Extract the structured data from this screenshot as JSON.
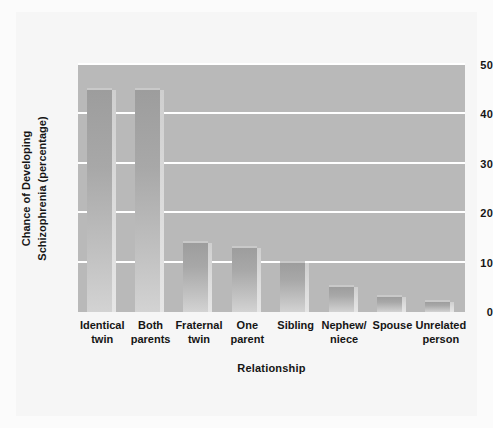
{
  "chart_data": {
    "type": "bar",
    "title": "",
    "xlabel": "Relationship",
    "ylabel": "Chance of Developing Schizophrenia (percentage)",
    "ylabel_lines": [
      "Chance of Developing",
      "Schizophrenia (percentage)"
    ],
    "categories": [
      "Identical\ntwin",
      "Both\nparents",
      "Fraternal\ntwin",
      "One\nparent",
      "Sibling",
      "Nephew/\nniece",
      "Spouse",
      "Unrelated\nperson"
    ],
    "values": [
      45,
      45,
      14,
      13,
      10,
      5,
      3,
      2
    ],
    "ylim": [
      0,
      50
    ],
    "yticks": [
      0,
      10,
      20,
      30,
      40,
      50
    ],
    "ytick_labels": [
      "0",
      "10",
      "20",
      "30",
      "40",
      "50"
    ],
    "grid": "horizontal-white",
    "legend": "none",
    "colors": {
      "plot_background": "#b9b9b9",
      "gridline": "#ffffff",
      "bar_top": "#9d9d9d",
      "bar_bottom": "#d3d3d3",
      "figure_background": "#f6f6f6",
      "text": "#151515"
    }
  }
}
